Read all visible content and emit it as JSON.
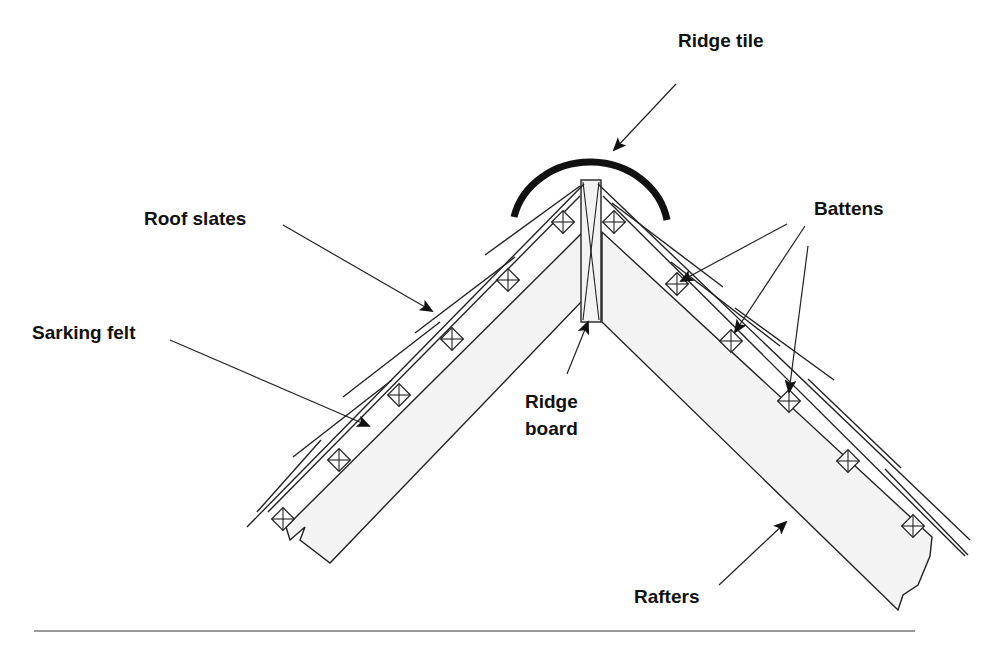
{
  "diagram": {
    "type": "roof ridge cross-section",
    "labels": {
      "ridge_tile": "Ridge tile",
      "roof_slates": "Roof slates",
      "battens": "Battens",
      "sarking_felt": "Sarking felt",
      "ridge_board_line1": "Ridge",
      "ridge_board_line2": "board",
      "rafters": "Rafters"
    },
    "colors": {
      "line": "#222222",
      "rafter_fill": "#f3f3f3",
      "ridge_tile": "#111111",
      "rule": "#9a9a9a"
    }
  }
}
